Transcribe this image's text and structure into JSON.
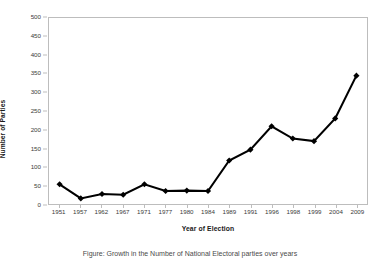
{
  "chart_data": {
    "type": "line",
    "title": "",
    "xlabel": "Year of Election",
    "ylabel": "Number of Parties",
    "categories": [
      "1951",
      "1957",
      "1962",
      "1967",
      "1971",
      "1977",
      "1980",
      "1984",
      "1989",
      "1991",
      "1996",
      "1998",
      "1999",
      "2004",
      "2009"
    ],
    "values": [
      53,
      15,
      27,
      25,
      53,
      35,
      36,
      35,
      117,
      146,
      209,
      176,
      169,
      230,
      345
    ],
    "ylim": [
      0,
      500
    ],
    "ytick_labels": [
      "0",
      "50",
      "100",
      "150",
      "200",
      "250",
      "300",
      "350",
      "400",
      "450",
      "500"
    ],
    "ytick_values": [
      0,
      50,
      100,
      150,
      200,
      250,
      300,
      350,
      400,
      450,
      500
    ],
    "grid": false,
    "legend": "none",
    "series_color": "#000000",
    "frame_color": "#bdbdbd",
    "marker": "diamond"
  },
  "caption": {
    "text": "Figure: Growth in the Number of National Electoral parties over years"
  }
}
